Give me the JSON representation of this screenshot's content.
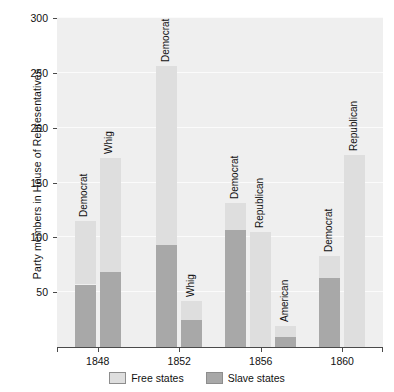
{
  "chart_data": {
    "type": "bar",
    "title": "",
    "xlabel": "",
    "ylabel": "Party members in House of Representatives",
    "ylim": [
      0,
      300
    ],
    "yticks": [
      50,
      100,
      150,
      200,
      250,
      300
    ],
    "grid": true,
    "stacked": true,
    "legend_position": "bottom",
    "categories": [
      "1848",
      "1852",
      "1856",
      "1860"
    ],
    "series": [
      {
        "name": "Free states",
        "color": "#dedede"
      },
      {
        "name": "Slave states",
        "color": "#a8a8a8"
      }
    ],
    "groups": [
      {
        "category": "1848",
        "bars": [
          {
            "party": "Democrat",
            "total": 115,
            "free": 58,
            "slave": 57
          },
          {
            "party": "Whig",
            "total": 172,
            "free": 104,
            "slave": 68
          }
        ]
      },
      {
        "category": "1852",
        "bars": [
          {
            "party": "Democrat",
            "total": 256,
            "free": 163,
            "slave": 93
          },
          {
            "party": "Whig",
            "total": 42,
            "free": 17,
            "slave": 25
          }
        ]
      },
      {
        "category": "1856",
        "bars": [
          {
            "party": "Democrat",
            "total": 131,
            "free": 24,
            "slave": 107
          },
          {
            "party": "Republican",
            "total": 105,
            "free": 105,
            "slave": 0
          },
          {
            "party": "American",
            "total": 19,
            "free": 10,
            "slave": 9
          }
        ]
      },
      {
        "category": "1860",
        "bars": [
          {
            "party": "Democrat",
            "total": 83,
            "free": 20,
            "slave": 63
          },
          {
            "party": "Republican",
            "total": 175,
            "free": 175,
            "slave": 0
          }
        ]
      }
    ]
  },
  "axis": {
    "y_title": "Party members in House of Representatives",
    "y_ticks": [
      "50",
      "100",
      "150",
      "200",
      "250",
      "300"
    ],
    "x_ticks": [
      "1848",
      "1852",
      "1856",
      "1860"
    ]
  },
  "legend": {
    "items": [
      {
        "label": "Free states",
        "color": "#dedede"
      },
      {
        "label": "Slave states",
        "color": "#a8a8a8"
      }
    ]
  }
}
